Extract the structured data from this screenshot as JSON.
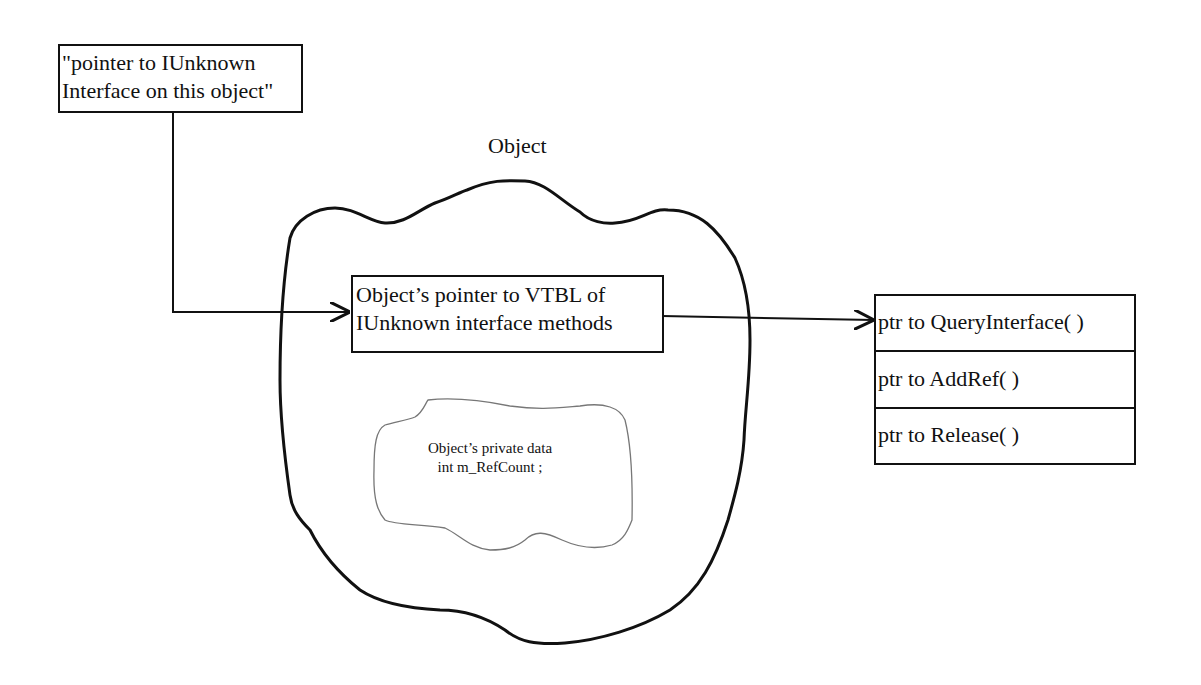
{
  "diagram": {
    "pointer_box": {
      "lines": [
        "\"pointer to IUnknown",
        "Interface on this object\""
      ]
    },
    "object_label": "Object",
    "vtbl_pointer_box": {
      "lines": [
        "Object’s pointer to VTBL of",
        "IUnknown interface methods"
      ]
    },
    "private_data": {
      "lines": [
        "Object’s private data",
        "int m_RefCount ;"
      ]
    },
    "vtable": {
      "rows": [
        {
          "label": "ptr to QueryInterface( )"
        },
        {
          "label": "ptr to AddRef( )"
        },
        {
          "label": "ptr to Release( )"
        }
      ]
    },
    "colors": {
      "stroke": "#111111",
      "thin_stroke": "#666666",
      "background": "#ffffff"
    }
  }
}
